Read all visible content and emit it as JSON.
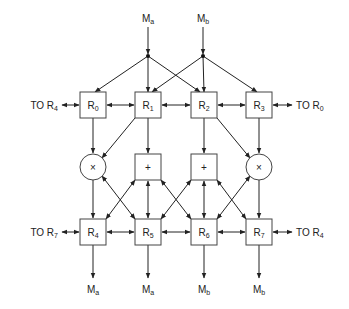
{
  "diagram": {
    "inputs": [
      {
        "id": "Ma",
        "main": "M",
        "sub": "a"
      },
      {
        "id": "Mb",
        "main": "M",
        "sub": "b"
      }
    ],
    "top_row": [
      {
        "id": "R0",
        "main": "R",
        "sub": "0"
      },
      {
        "id": "R1",
        "main": "R",
        "sub": "1"
      },
      {
        "id": "R2",
        "main": "R",
        "sub": "2"
      },
      {
        "id": "R3",
        "main": "R",
        "sub": "3"
      }
    ],
    "ops": [
      {
        "id": "mul_left",
        "symbol": "×",
        "shape": "circle"
      },
      {
        "id": "add_left",
        "symbol": "+",
        "shape": "box"
      },
      {
        "id": "add_right",
        "symbol": "+",
        "shape": "box"
      },
      {
        "id": "mul_right",
        "symbol": "×",
        "shape": "circle"
      }
    ],
    "bottom_row": [
      {
        "id": "R4",
        "main": "R",
        "sub": "4"
      },
      {
        "id": "R5",
        "main": "R",
        "sub": "5"
      },
      {
        "id": "R6",
        "main": "R",
        "sub": "6"
      },
      {
        "id": "R7",
        "main": "R",
        "sub": "7"
      }
    ],
    "outputs": [
      {
        "main": "M",
        "sub": "a"
      },
      {
        "main": "M",
        "sub": "a"
      },
      {
        "main": "M",
        "sub": "b"
      },
      {
        "main": "M",
        "sub": "b"
      }
    ],
    "side_links": {
      "top_left": {
        "prefix": "TO",
        "main": "R",
        "sub": "4"
      },
      "top_right": {
        "prefix": "TO",
        "main": "R",
        "sub": "0"
      },
      "bottom_left": {
        "prefix": "TO",
        "main": "R",
        "sub": "7"
      },
      "bottom_right": {
        "prefix": "TO",
        "main": "R",
        "sub": "4"
      }
    }
  }
}
